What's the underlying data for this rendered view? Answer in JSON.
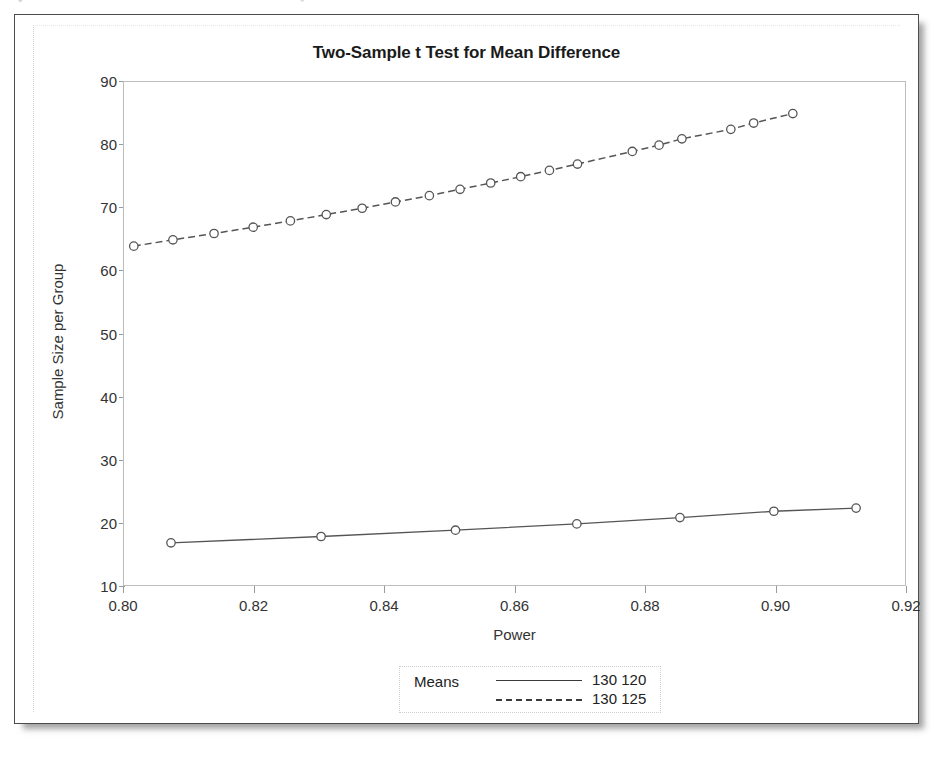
{
  "scan_artifact": {
    "left_text": "•",
    "right_text": "▪"
  },
  "chart_data": {
    "type": "line",
    "title": "Two-Sample t Test for Mean Difference",
    "xlabel": "Power",
    "ylabel": "Sample Size per Group",
    "xlim": [
      0.8,
      0.92
    ],
    "ylim": [
      10,
      90
    ],
    "xticks": [
      0.8,
      0.82,
      0.84,
      0.86,
      0.88,
      0.9,
      0.92
    ],
    "xtick_labels": [
      "0.80",
      "0.82",
      "0.84",
      "0.86",
      "0.88",
      "0.90",
      "0.92"
    ],
    "yticks": [
      10,
      20,
      30,
      40,
      50,
      60,
      70,
      80,
      90
    ],
    "ytick_labels": [
      "10",
      "20",
      "30",
      "40",
      "50",
      "60",
      "70",
      "80",
      "90"
    ],
    "grid": false,
    "legend_position": "below-center",
    "legend_title": "Means",
    "marker": "circle-open",
    "line_color": "#555555",
    "series": [
      {
        "name": "130 120",
        "label": "130 120",
        "linestyle": "solid",
        "points": [
          {
            "x": 0.8072,
            "y": 17.0
          },
          {
            "x": 0.8302,
            "y": 18.0
          },
          {
            "x": 0.8508,
            "y": 19.0
          },
          {
            "x": 0.8694,
            "y": 20.0
          },
          {
            "x": 0.8852,
            "y": 21.0
          },
          {
            "x": 0.8996,
            "y": 22.0
          },
          {
            "x": 0.9122,
            "y": 22.5
          }
        ]
      },
      {
        "name": "130 125",
        "label": "130 125",
        "linestyle": "dashed",
        "points": [
          {
            "x": 0.8015,
            "y": 64.0
          },
          {
            "x": 0.8075,
            "y": 65.0
          },
          {
            "x": 0.8138,
            "y": 66.0
          },
          {
            "x": 0.8198,
            "y": 67.0
          },
          {
            "x": 0.8255,
            "y": 68.0
          },
          {
            "x": 0.831,
            "y": 69.0
          },
          {
            "x": 0.8365,
            "y": 70.0
          },
          {
            "x": 0.8416,
            "y": 71.0
          },
          {
            "x": 0.8468,
            "y": 72.0
          },
          {
            "x": 0.8515,
            "y": 73.0
          },
          {
            "x": 0.8562,
            "y": 74.0
          },
          {
            "x": 0.8608,
            "y": 75.0
          },
          {
            "x": 0.8652,
            "y": 76.0
          },
          {
            "x": 0.8695,
            "y": 77.0
          },
          {
            "x": 0.8779,
            "y": 79.0
          },
          {
            "x": 0.882,
            "y": 80.0
          },
          {
            "x": 0.8855,
            "y": 81.0
          },
          {
            "x": 0.893,
            "y": 82.5
          },
          {
            "x": 0.8965,
            "y": 83.5
          },
          {
            "x": 0.9025,
            "y": 85.0
          }
        ]
      }
    ]
  }
}
